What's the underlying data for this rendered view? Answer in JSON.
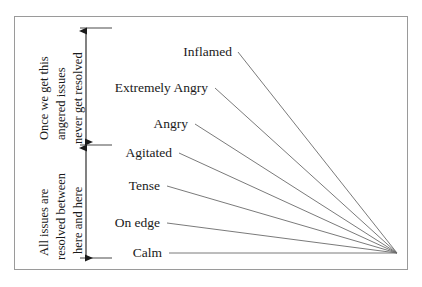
{
  "diagram": {
    "frame": {
      "x": 14,
      "y": 16,
      "width": 394,
      "height": 254,
      "border_color": "#9a9a9a"
    },
    "convergence_point": {
      "x": 397,
      "y": 253
    },
    "line_color": "#6b6b6b",
    "axis_color": "#1a1a1a",
    "levels": [
      {
        "label": "Inflamed",
        "label_right_x": 232,
        "y": 52,
        "line_start_x": 238
      },
      {
        "label": "Extremely Angry",
        "label_right_x": 208,
        "y": 88,
        "line_start_x": 215
      },
      {
        "label": "Angry",
        "label_right_x": 188,
        "y": 124,
        "line_start_x": 195
      },
      {
        "label": "Agitated",
        "label_right_x": 172,
        "y": 153,
        "line_start_x": 179
      },
      {
        "label": "Tense",
        "label_right_x": 160,
        "y": 186,
        "line_start_x": 167
      },
      {
        "label": "On edge",
        "label_right_x": 160,
        "y": 223,
        "line_start_x": 167
      },
      {
        "label": "Calm",
        "label_right_x": 162,
        "y": 253,
        "line_start_x": 169
      }
    ],
    "ticks": [
      {
        "name": "top-tick",
        "y": 28,
        "x1": 80,
        "x2": 112
      },
      {
        "name": "middle-tick",
        "y": 145,
        "x1": 80,
        "x2": 112
      },
      {
        "name": "bottom-tick",
        "y": 258,
        "x1": 80,
        "x2": 112
      }
    ],
    "arrows": [
      {
        "name": "upper-range-arrow",
        "x": 86,
        "y_top": 31,
        "y_bottom": 142
      },
      {
        "name": "lower-range-arrow",
        "x": 86,
        "y_top": 148,
        "y_bottom": 258
      }
    ],
    "annotations": {
      "upper": {
        "name": "upper-range-annotation",
        "lines": [
          {
            "text": "Once we get this",
            "x": 38,
            "y_bottom": 140
          },
          {
            "text": "angered issues",
            "x": 55,
            "y_bottom": 140
          },
          {
            "text": "never get resolved",
            "x": 72,
            "y_bottom": 144
          }
        ]
      },
      "lower": {
        "name": "lower-range-annotation",
        "lines": [
          {
            "text": "All issues are",
            "x": 38,
            "y_bottom": 256
          },
          {
            "text": "resolved between",
            "x": 55,
            "y_bottom": 260
          },
          {
            "text": "here and here",
            "x": 72,
            "y_bottom": 254
          }
        ]
      }
    }
  }
}
